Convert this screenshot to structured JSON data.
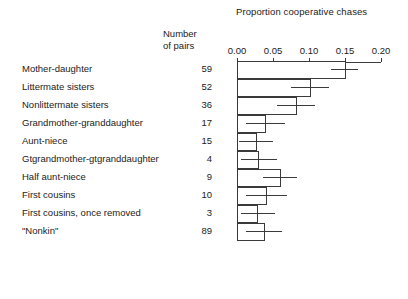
{
  "chart_data": {
    "type": "bar",
    "title": "Proportion cooperative chases",
    "xlabel": "",
    "ylabel": "",
    "orientation": "horizontal",
    "grid": false,
    "legend": null,
    "xlim": [
      0.0,
      0.2
    ],
    "xticks": [
      0.0,
      0.05,
      0.1,
      0.15,
      0.2
    ],
    "xtick_labels": [
      "0.00",
      "0.05",
      "0.10",
      "0.15",
      "0.20"
    ],
    "axis_position": "top",
    "pairs_header_line1": "Number",
    "pairs_header_line2": "of pairs",
    "categories": [
      "Mother-daughter",
      "Littermate sisters",
      "Nonlittermate sisters",
      "Grandmother-granddaughter",
      "Aunt-niece",
      "Gtgrandmother-gtgranddaughter",
      "Half aunt-niece",
      "First cousins",
      "First cousins, once removed",
      "\"Nonkin\""
    ],
    "number_of_pairs": [
      59,
      52,
      36,
      17,
      15,
      4,
      9,
      10,
      3,
      89
    ],
    "values": [
      0.15,
      0.102,
      0.082,
      0.04,
      0.027,
      0.03,
      0.06,
      0.041,
      0.029,
      0.038
    ],
    "error_low": [
      0.13,
      0.075,
      0.055,
      0.013,
      0.003,
      0.005,
      0.036,
      0.013,
      0.005,
      0.013
    ],
    "error_high": [
      0.168,
      0.128,
      0.108,
      0.066,
      0.05,
      0.055,
      0.083,
      0.07,
      0.053,
      0.062
    ],
    "error_center": [
      0.15,
      0.102,
      0.082,
      0.04,
      0.027,
      0.03,
      0.06,
      0.041,
      0.029,
      0.038
    ]
  },
  "colors": {
    "ink": "#3a3a3a",
    "text": "#1b1b1b",
    "background": "#ffffff"
  }
}
